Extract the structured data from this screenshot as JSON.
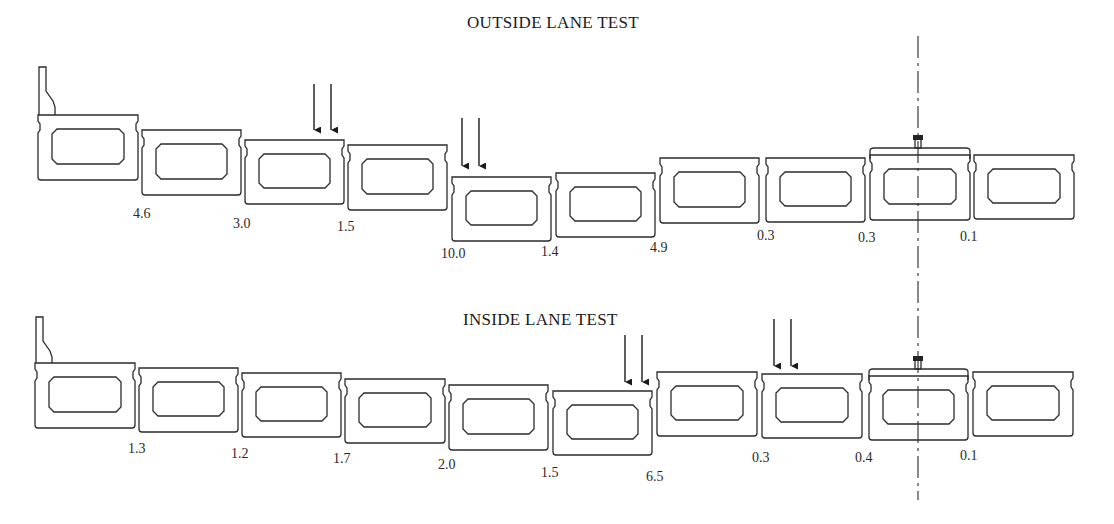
{
  "outside": {
    "title": "OUTSIDE LANE TEST",
    "title_pos": [
      467,
      13
    ],
    "boxes": [
      {
        "x": 38,
        "y": 115,
        "w": 100,
        "h": 65
      },
      {
        "x": 142,
        "y": 130,
        "w": 99,
        "h": 65
      },
      {
        "x": 245,
        "y": 140,
        "w": 99,
        "h": 64
      },
      {
        "x": 348,
        "y": 145,
        "w": 99,
        "h": 65
      },
      {
        "x": 452,
        "y": 177,
        "w": 99,
        "h": 64
      },
      {
        "x": 556,
        "y": 173,
        "w": 99,
        "h": 64
      },
      {
        "x": 660,
        "y": 158,
        "w": 99,
        "h": 65
      },
      {
        "x": 766,
        "y": 158,
        "w": 99,
        "h": 64
      },
      {
        "x": 870,
        "y": 155,
        "w": 100,
        "h": 65
      },
      {
        "x": 974,
        "y": 155,
        "w": 100,
        "h": 64
      }
    ],
    "parapet": {
      "x": 39,
      "top": 67,
      "base": 115
    },
    "cap_box_index": 8,
    "load_arrows": [
      {
        "x1": 314,
        "x2": 331,
        "top": 84,
        "tip": 130
      },
      {
        "x1": 462,
        "x2": 479,
        "top": 118,
        "tip": 166
      }
    ],
    "displacements": [
      {
        "value": "4.6",
        "x": 133,
        "y": 218
      },
      {
        "value": "3.0",
        "x": 233,
        "y": 228
      },
      {
        "value": "1.5",
        "x": 337,
        "y": 231
      },
      {
        "value": "10.0",
        "x": 441,
        "y": 258
      },
      {
        "value": "1.4",
        "x": 541,
        "y": 256
      },
      {
        "value": "4.9",
        "x": 650,
        "y": 252
      },
      {
        "value": "0.3",
        "x": 757,
        "y": 240
      },
      {
        "value": "0.3",
        "x": 858,
        "y": 242
      },
      {
        "value": "0.1",
        "x": 960,
        "y": 241
      }
    ]
  },
  "inside": {
    "title": "INSIDE LANE TEST",
    "title_pos": [
      463,
      310
    ],
    "boxes": [
      {
        "x": 35,
        "y": 363,
        "w": 100,
        "h": 65
      },
      {
        "x": 139,
        "y": 368,
        "w": 99,
        "h": 64
      },
      {
        "x": 242,
        "y": 373,
        "w": 99,
        "h": 64
      },
      {
        "x": 345,
        "y": 379,
        "w": 100,
        "h": 64
      },
      {
        "x": 449,
        "y": 385,
        "w": 99,
        "h": 65
      },
      {
        "x": 553,
        "y": 391,
        "w": 99,
        "h": 64
      },
      {
        "x": 657,
        "y": 372,
        "w": 100,
        "h": 64
      },
      {
        "x": 762,
        "y": 374,
        "w": 100,
        "h": 64
      },
      {
        "x": 869,
        "y": 376,
        "w": 99,
        "h": 64
      },
      {
        "x": 973,
        "y": 372,
        "w": 100,
        "h": 64
      }
    ],
    "parapet": {
      "x": 36,
      "top": 317,
      "base": 363
    },
    "cap_box_index": 8,
    "load_arrows": [
      {
        "x1": 625,
        "x2": 642,
        "top": 335,
        "tip": 382
      },
      {
        "x1": 774,
        "x2": 791,
        "top": 319,
        "tip": 366
      }
    ],
    "displacements": [
      {
        "value": "1.3",
        "x": 128,
        "y": 453
      },
      {
        "value": "1.2",
        "x": 231,
        "y": 458
      },
      {
        "value": "1.7",
        "x": 333,
        "y": 463
      },
      {
        "value": "2.0",
        "x": 438,
        "y": 469
      },
      {
        "value": "1.5",
        "x": 541,
        "y": 477
      },
      {
        "value": "6.5",
        "x": 646,
        "y": 481
      },
      {
        "value": "0.3",
        "x": 752,
        "y": 462
      },
      {
        "value": "0.4",
        "x": 855,
        "y": 462
      },
      {
        "value": "0.1",
        "x": 960,
        "y": 460
      }
    ]
  },
  "centerline": {
    "x": 918,
    "top": 36,
    "bottom": 500
  }
}
